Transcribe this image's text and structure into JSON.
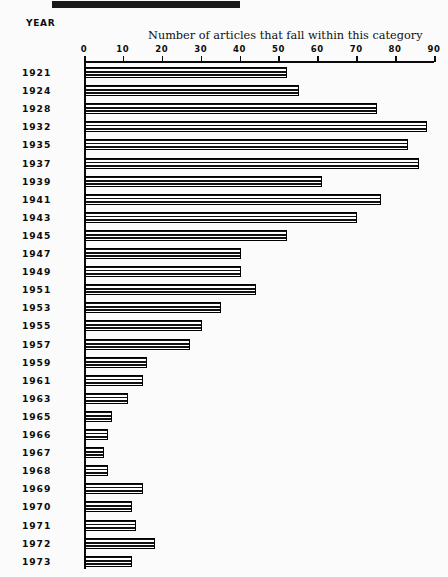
{
  "chart_data": {
    "type": "bar",
    "orientation": "horizontal",
    "title": "Number of articles that fall within this category",
    "xlabel": "Number of articles that fall within this category",
    "ylabel": "YEAR",
    "xlim": [
      0,
      90
    ],
    "xticks": [
      0,
      10,
      20,
      30,
      40,
      50,
      60,
      70,
      80,
      90
    ],
    "xtick_labels": [
      "0",
      "10",
      "20",
      "30",
      "40",
      "50",
      "60",
      "70",
      "80",
      "90"
    ],
    "grid": false,
    "legend": null,
    "categories": [
      "1921",
      "1924",
      "1928",
      "1932",
      "1935",
      "1937",
      "1939",
      "1941",
      "1943",
      "1945",
      "1947",
      "1949",
      "1951",
      "1953",
      "1955",
      "1957",
      "1959",
      "1961",
      "1963",
      "1965",
      "1966",
      "1967",
      "1968",
      "1969",
      "1970",
      "1971",
      "1972",
      "1973"
    ],
    "values": [
      52,
      55,
      75,
      88,
      83,
      86,
      61,
      76,
      70,
      52,
      40,
      40,
      44,
      35,
      30,
      27,
      16,
      15,
      11,
      7,
      6,
      5,
      6,
      15,
      12,
      13,
      18,
      12
    ]
  },
  "axis": {
    "year_axis_label": "YEAR"
  }
}
